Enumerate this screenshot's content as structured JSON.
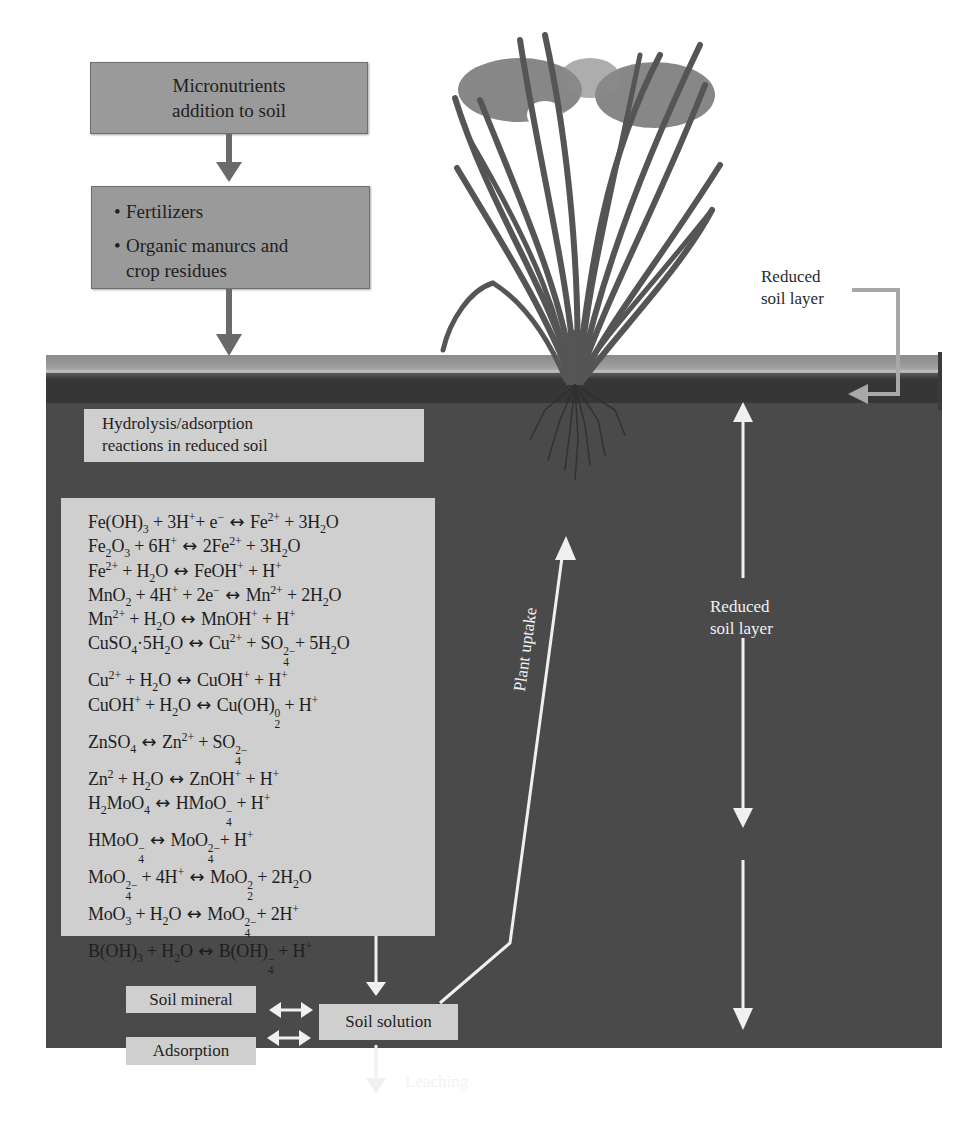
{
  "flow": {
    "top_box": {
      "line1": "Micronutrients",
      "line2": "addition to soil"
    },
    "sources_box": {
      "items": [
        "Fertilizers",
        "Organic manurcs and",
        "crop residues"
      ],
      "bullet": "•"
    }
  },
  "labels": {
    "reduced_layer_top": {
      "line1": "Reduced",
      "line2": "soil layer"
    },
    "reduced_layer_mid": {
      "line1": "Reduced",
      "line2": "soil layer"
    },
    "plant_uptake": "Plant uptake",
    "leaching": "Leaching"
  },
  "hydrolysis_box": {
    "line1": "Hydrolysis/adsorption",
    "line2": "reactions in reduced soil"
  },
  "reactions": [
    {
      "lhs": "Fe(OH)₃ + 3H⁺+ e⁻",
      "rhs": "Fe²⁺ + 3H₂O"
    },
    {
      "lhs": "Fe₂O₃ + 6H⁺",
      "rhs": "2Fe²⁺ + 3H₂O"
    },
    {
      "lhs": "Fe²⁺ + H₂O",
      "rhs": "FeOH⁺ + H⁺"
    },
    {
      "lhs": "MnO₂ + 4H⁺ + 2e⁻",
      "rhs": "Mn²⁺ + 2H₂O"
    },
    {
      "lhs": "Mn²⁺ + H₂O",
      "rhs": "MnOH⁺ + H⁺"
    },
    {
      "lhs": "CuSO₄·5H₂O",
      "rhs": "Cu²⁺ + SO₄²⁻+ 5H₂O"
    },
    {
      "lhs": "Cu²⁺ + H₂O",
      "rhs": "CuOH⁺ + H⁺"
    },
    {
      "lhs": "CuOH⁺ + H₂O",
      "rhs": "Cu(OH)₂⁰ + H⁺"
    },
    {
      "lhs": "ZnSO₄",
      "rhs": "Zn²⁺ + SO₄²⁻"
    },
    {
      "lhs": "Zn² + H₂O",
      "rhs": "ZnOH⁺ + H⁺"
    },
    {
      "lhs": "H₂MoO₄",
      "rhs": "HMoO₄⁻ + H⁺"
    },
    {
      "lhs": "HMoO₄⁻",
      "rhs": "MoO₄²⁻+ H⁺"
    },
    {
      "lhs": "MoO₄²⁻ + 4H⁺",
      "rhs": "MoO₂² + 2H₂O"
    },
    {
      "lhs": "MoO₃ + H₂O",
      "rhs": "MoO₄²⁻+ 2H⁺"
    },
    {
      "lhs": "B(OH)₃ + H₂O",
      "rhs": "B(OH)₄⁻ + H⁺"
    }
  ],
  "reaction_arrow": "↔",
  "pools": {
    "soil_mineral": "Soil mineral",
    "adsorption": "Adsorption",
    "soil_solution": "Soil solution"
  },
  "colors": {
    "soil": "#4a4a4a",
    "box_dark": "#9a9a9a",
    "box_light": "#cfcfcf",
    "arrow_white": "#f0f0f0",
    "arrow_gray": "#6a6a6a",
    "plant": "#555555"
  }
}
